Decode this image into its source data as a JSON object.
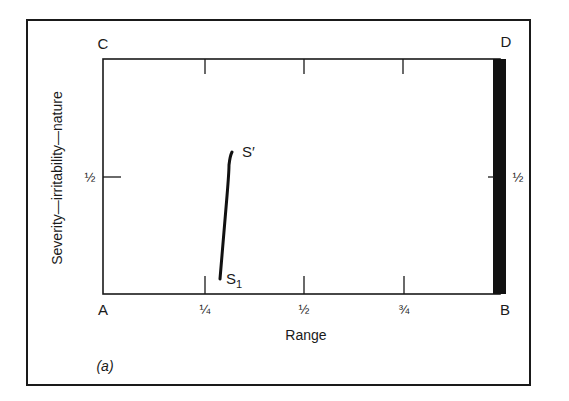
{
  "figure": {
    "panel_label": "(a)",
    "x_axis": {
      "title": "Range",
      "ticks": [
        {
          "value": 0.25,
          "label": "¼"
        },
        {
          "value": 0.5,
          "label": "½"
        },
        {
          "value": 0.75,
          "label": "¾"
        }
      ]
    },
    "y_axis": {
      "title": "Severity—irritability—nature",
      "ticks": [
        {
          "value": 0.5,
          "label": "½"
        }
      ],
      "right_tick_label": "½"
    },
    "corners": {
      "top_left": "C",
      "top_right": "D",
      "bottom_left": "A",
      "bottom_right": "B"
    },
    "curve": {
      "start_label": "S",
      "start_subscript": "1",
      "end_label": "S′"
    },
    "colors": {
      "ink": "#1a1a1a",
      "background": "#ffffff",
      "bar": "#111111"
    }
  }
}
